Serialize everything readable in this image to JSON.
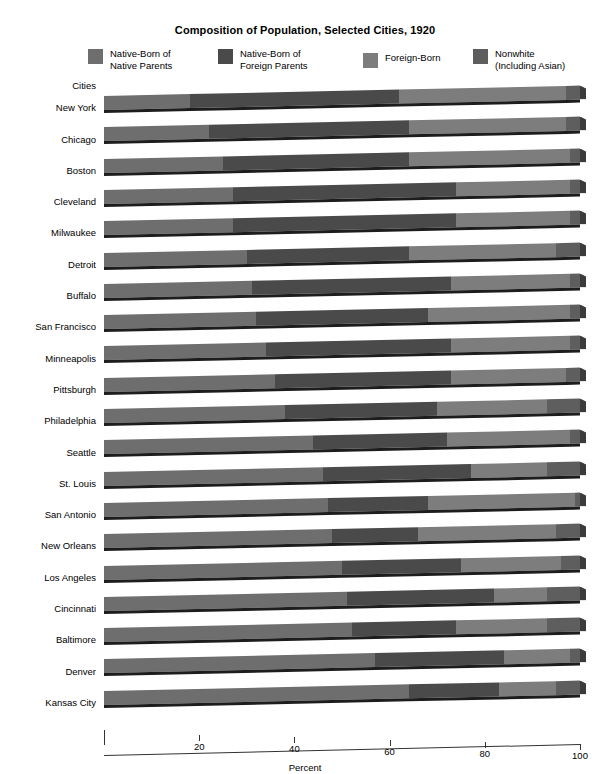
{
  "chart_data": {
    "type": "bar",
    "orientation": "horizontal",
    "stacked": true,
    "title": "Composition of Population, Selected Cities, 1920",
    "xlabel": "Percent",
    "ylabel": "Cities",
    "xlim": [
      0,
      100
    ],
    "xticks": [
      20,
      40,
      60,
      80,
      100
    ],
    "xtick_labels": [
      "20",
      "40",
      "60",
      "80",
      "100"
    ],
    "grid": false,
    "legend_position": "top",
    "colors": {
      "native_born_native_parents": "#6e6e6e",
      "native_born_foreign_parents": "#4a4a4a",
      "foreign_born": "#7d7d7d",
      "nonwhite": "#5e5e5e",
      "shadow": "#1d1d1d"
    },
    "legend": [
      {
        "label": "Native-Born of\nNative Parents",
        "color": "#6e6e6e"
      },
      {
        "label": "Native-Born of\nForeign Parents",
        "color": "#4a4a4a"
      },
      {
        "label": "Foreign-Born",
        "color": "#7d7d7d"
      },
      {
        "label": "Nonwhite\n(Including Asian)",
        "color": "#5e5e5e"
      }
    ],
    "categories": [
      "New York",
      "Chicago",
      "Boston",
      "Cleveland",
      "Milwaukee",
      "Detroit",
      "Buffalo",
      "San Francisco",
      "Minneapolis",
      "Pittsburgh",
      "Philadelphia",
      "Seattle",
      "St. Louis",
      "San Antonio",
      "New Orleans",
      "Los Angeles",
      "Cincinnati",
      "Baltimore",
      "Denver",
      "Kansas City"
    ],
    "series": [
      {
        "name": "Native-Born of Native Parents",
        "values": [
          18,
          22,
          25,
          27,
          27,
          30,
          31,
          32,
          34,
          36,
          38,
          44,
          46,
          47,
          48,
          50,
          51,
          52,
          57,
          64
        ]
      },
      {
        "name": "Native-Born of Foreign Parents",
        "values": [
          44,
          42,
          39,
          47,
          47,
          34,
          42,
          36,
          39,
          37,
          32,
          28,
          31,
          21,
          18,
          25,
          31,
          22,
          27,
          19
        ]
      },
      {
        "name": "Foreign-Born",
        "values": [
          35,
          33,
          34,
          24,
          24,
          31,
          25,
          30,
          25,
          24,
          23,
          26,
          16,
          31,
          29,
          21,
          11,
          19,
          14,
          12
        ]
      },
      {
        "name": "Nonwhite (Including Asian)",
        "values": [
          3,
          3,
          2,
          2,
          2,
          5,
          2,
          2,
          2,
          3,
          7,
          2,
          7,
          1,
          5,
          4,
          7,
          7,
          2,
          5
        ]
      }
    ]
  },
  "axis": {
    "y_title": "Cities",
    "x_title": "Percent"
  }
}
